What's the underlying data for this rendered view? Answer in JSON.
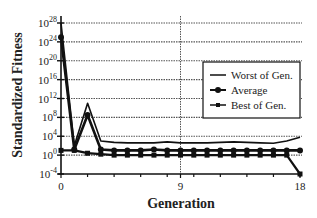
{
  "chart_data": {
    "type": "line",
    "title": "",
    "xlabel": "Generation",
    "ylabel": "Standardized Fitness",
    "yscale": "log10",
    "x": [
      0,
      1,
      2,
      3,
      4,
      5,
      6,
      7,
      8,
      9,
      10,
      11,
      12,
      13,
      14,
      15,
      16,
      17,
      18
    ],
    "x_ticks": [
      0,
      9,
      18
    ],
    "y_ticks_exp": [
      28,
      24,
      20,
      16,
      12,
      8,
      4,
      0,
      -4
    ],
    "ylim_exp": [
      -4,
      28
    ],
    "xlim": [
      0,
      18
    ],
    "grid": {
      "horizontal": true,
      "vertical_at": [
        9
      ],
      "style": "dotted"
    },
    "legend": {
      "position": "upper-right-inside",
      "entries": [
        "Worst of Gen.",
        "Average",
        "Best of Gen."
      ]
    },
    "series": [
      {
        "name": "Worst of Gen.",
        "marker": "none",
        "values_log10": [
          28,
          2,
          11,
          3,
          2.7,
          2.6,
          2.6,
          2.6,
          2.8,
          2.6,
          2.6,
          2.6,
          2.7,
          2.8,
          2.7,
          2.6,
          2.5,
          3,
          3.8
        ]
      },
      {
        "name": "Average",
        "marker": "circle",
        "values_log10": [
          25,
          1.2,
          8.5,
          1.2,
          1,
          1,
          1,
          1.2,
          1,
          1,
          1,
          1,
          1,
          1,
          1,
          1,
          1,
          1,
          1
        ]
      },
      {
        "name": "Best of Gen.",
        "marker": "square",
        "values_log10": [
          1,
          1,
          0.4,
          0.2,
          0,
          0,
          0,
          0,
          0,
          0,
          0,
          0,
          0,
          0,
          0,
          0,
          0,
          0,
          -4
        ]
      }
    ]
  },
  "axis": {
    "ylabel": "Standardized Fitness",
    "xlabel": "Generation",
    "x_tick_labels": [
      "0",
      "9",
      "18"
    ],
    "y_tick_base": "10",
    "y_tick_exponents": [
      "28",
      "24",
      "20",
      "16",
      "12",
      "8",
      "4",
      "0",
      "-4"
    ]
  },
  "legend": {
    "items": [
      {
        "label": "Worst of Gen.",
        "marker": "none"
      },
      {
        "label": "Average",
        "marker": "circle"
      },
      {
        "label": "Best of Gen.",
        "marker": "square"
      }
    ]
  },
  "colors": {
    "line": "#111111",
    "grid": "#555555",
    "background": "#ffffff"
  }
}
